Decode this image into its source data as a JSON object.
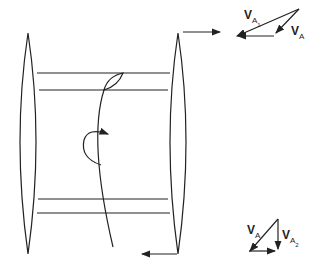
{
  "diagram": {
    "colors": {
      "stroke": "#222222",
      "background": "#ffffff"
    },
    "top_triangle": {
      "labels": {
        "v_a1_main": "V",
        "v_a1_sub": "A",
        "v_a1_subsub": "1",
        "v_a_main": "V",
        "v_a_sub": "A"
      }
    },
    "bottom_triangle": {
      "labels": {
        "v_a_main": "V",
        "v_a_sub": "A",
        "v_a2_main": "V",
        "v_a2_sub": "A",
        "v_a2_subsub": "2"
      }
    },
    "icons": [
      "rotation-arrow-icon",
      "flow-arrow-right-icon",
      "flow-arrow-left-icon"
    ]
  }
}
